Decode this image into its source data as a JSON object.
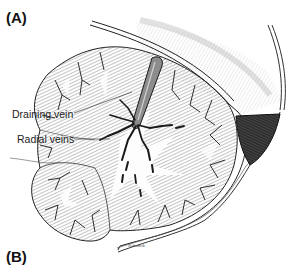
{
  "figure": {
    "panels": [
      {
        "label": "(A)"
      },
      {
        "label": "(B)"
      }
    ],
    "annotations": [
      {
        "text": "Draining vein"
      },
      {
        "text": "Radial veins"
      }
    ],
    "signature": "Schanck",
    "colors": {
      "background": "#ffffff",
      "ink": "#1a1a1a",
      "hatch": "#8a8a8a",
      "dark_fill": "#3a3a3a"
    }
  }
}
